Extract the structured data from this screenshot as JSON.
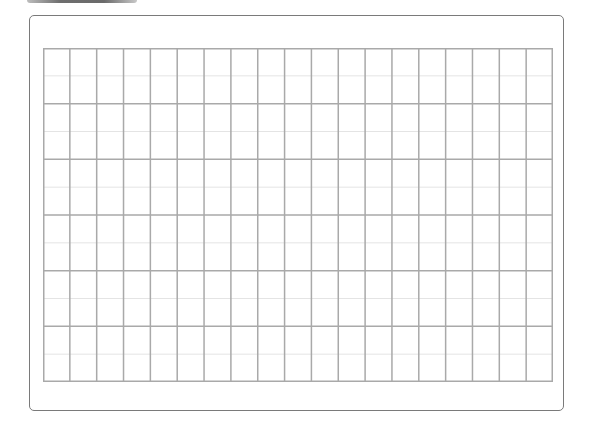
{
  "document": {
    "type": "blank ruled grid sheet",
    "frame_color": "#7a7a7a",
    "tab_color": "#6e6e6e",
    "background": "#ffffff"
  },
  "grid": {
    "columns": 19,
    "rows": 6,
    "subdivisions_per_row": 2,
    "major_line_color": "#a9a9a9",
    "minor_line_color": "#e4e4e4",
    "width": 510,
    "height": 334
  }
}
